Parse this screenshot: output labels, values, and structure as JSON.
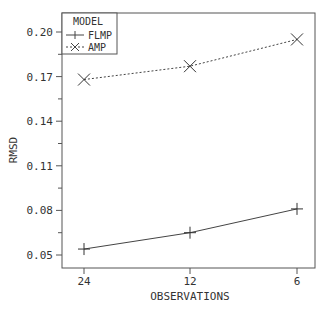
{
  "chart_data": {
    "type": "line",
    "title": "",
    "xlabel": "OBSERVATIONS",
    "ylabel": "RMSD",
    "categories": [
      "24",
      "12",
      "6"
    ],
    "series": [
      {
        "name": "FLMP",
        "marker": "plus",
        "line": "solid",
        "values": [
          0.054,
          0.065,
          0.081
        ]
      },
      {
        "name": "AMP",
        "marker": "x",
        "line": "dotted",
        "values": [
          0.168,
          0.177,
          0.195
        ]
      }
    ],
    "yticks": [
      "0.05",
      "0.08",
      "0.11",
      "0.14",
      "0.17",
      "0.20"
    ],
    "ylim": [
      0.045,
      0.21
    ],
    "grid": false,
    "legend": {
      "title": "MODEL",
      "position": "upper-left"
    }
  },
  "colors": {
    "line": "#444444",
    "axis": "#555555",
    "text": "#333333"
  }
}
